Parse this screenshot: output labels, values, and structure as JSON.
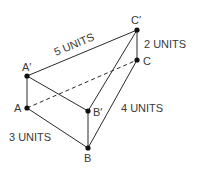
{
  "diagram": {
    "type": "triangular-prism-translation",
    "points": {
      "A": {
        "label": "A",
        "x": 27,
        "y": 108
      },
      "A_prime": {
        "label": "A′",
        "x": 27,
        "y": 76
      },
      "B": {
        "label": "B",
        "x": 88,
        "y": 148
      },
      "B_prime": {
        "label": "B′",
        "x": 88,
        "y": 111
      },
      "C": {
        "label": "C",
        "x": 137,
        "y": 60
      },
      "C_prime": {
        "label": "C′",
        "x": 137,
        "y": 30
      }
    },
    "measurements": {
      "a_prime_c_prime": "5 UNITS",
      "c_prime_c": "2 UNITS",
      "b_c": "4 UNITS",
      "a_b": "3 UNITS"
    },
    "colors": {
      "line": "#2a2a2a",
      "text": "#3a3a3a",
      "point": "#111111"
    }
  }
}
